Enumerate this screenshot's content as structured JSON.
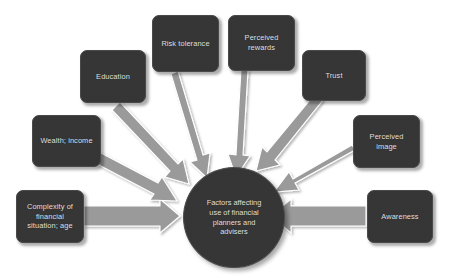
{
  "diagram": {
    "title": "Factors affecting use of financial planners and advisers",
    "background_color": "#ffffff",
    "node_fill_color": "#343434",
    "node_text_color": "#e8e8e8",
    "arrow_fill_color": "#9a9a9a",
    "arrow_outline_color": "#ffffff",
    "center": {
      "label": "Factors affecting\nuse of financial\nplanners and\nadvisers",
      "shape": "circle"
    },
    "nodes": [
      {
        "id": "complexity",
        "label": "Complexity of\nfinancial\nsituation; age",
        "shape": "rounded-rect"
      },
      {
        "id": "wealth-income",
        "label": "Wealth; income",
        "shape": "rounded-rect"
      },
      {
        "id": "education",
        "label": "Education",
        "shape": "rounded-rect"
      },
      {
        "id": "risk-tolerance",
        "label": "Risk tolerance",
        "shape": "rounded-rect"
      },
      {
        "id": "perceived-rewards",
        "label": "Perceived\nrewards",
        "shape": "rounded-rect"
      },
      {
        "id": "trust",
        "label": "Trust",
        "shape": "rounded-rect"
      },
      {
        "id": "perceived-image",
        "label": "Perceived\nimage",
        "shape": "rounded-rect"
      },
      {
        "id": "awareness",
        "label": "Awareness",
        "shape": "rounded-rect"
      }
    ],
    "arrows": [
      {
        "from": "complexity",
        "to": "center",
        "direction": "right"
      },
      {
        "from": "wealth-income",
        "to": "center",
        "direction": "down-right"
      },
      {
        "from": "education",
        "to": "center",
        "direction": "down-right"
      },
      {
        "from": "risk-tolerance",
        "to": "center",
        "direction": "down"
      },
      {
        "from": "perceived-rewards",
        "to": "center",
        "direction": "down"
      },
      {
        "from": "trust",
        "to": "center",
        "direction": "down-left"
      },
      {
        "from": "perceived-image",
        "to": "center",
        "direction": "down-left"
      },
      {
        "from": "awareness",
        "to": "center",
        "direction": "left"
      }
    ]
  }
}
